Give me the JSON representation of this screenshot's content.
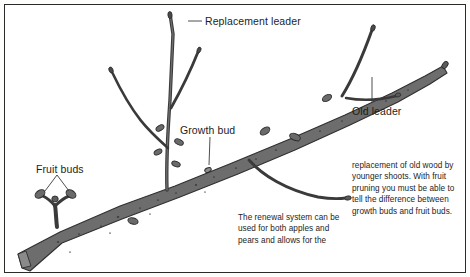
{
  "figure": {
    "border_color": "#2b2b2b",
    "background_color": "#ffffff",
    "ink_color": "#3a3a3a",
    "wood_fill_color": "#6e6e6e"
  },
  "labels": {
    "replacement_leader": "Replacement leader",
    "old_leader": "Old leader",
    "growth_bud": "Growth bud",
    "fruit_buds": "Fruit buds"
  },
  "captions": {
    "left": "The renewal system can be used for both apples and pears and allows for the",
    "right": "replacement of old wood by younger shoots. With fruit pruning you must be able to tell the difference between growth buds and fruit buds."
  }
}
